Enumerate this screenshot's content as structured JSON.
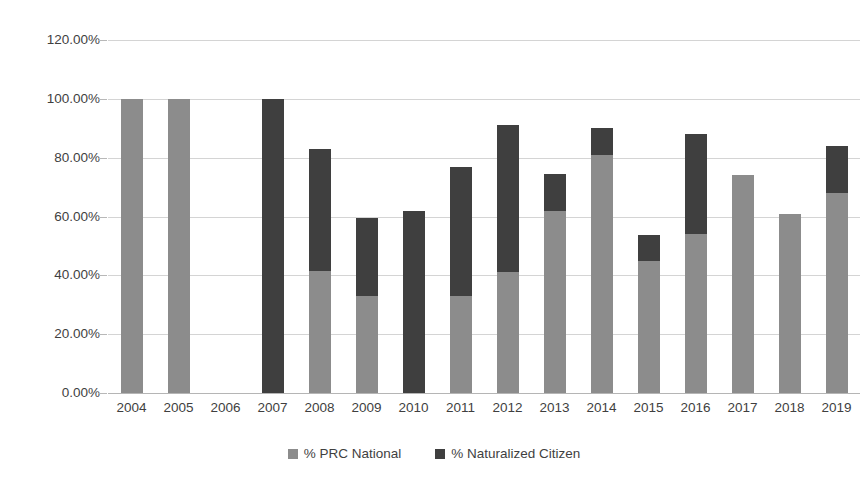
{
  "chart_data": {
    "type": "bar",
    "stacked": true,
    "title": "",
    "subtitle": "",
    "xlabel": "",
    "ylabel": "",
    "categories": [
      "2004",
      "2005",
      "2006",
      "2007",
      "2008",
      "2009",
      "2010",
      "2011",
      "2012",
      "2013",
      "2014",
      "2015",
      "2016",
      "2017",
      "2018",
      "2019"
    ],
    "series": [
      {
        "name": "% PRC National",
        "color": "#8c8c8c",
        "values": [
          100.0,
          100.0,
          0.0,
          0.0,
          41.5,
          33.0,
          0.0,
          33.0,
          41.0,
          62.0,
          81.0,
          45.0,
          54.0,
          74.0,
          60.7,
          68.0
        ]
      },
      {
        "name": "% Naturalized Citizen",
        "color": "#3f3f3f",
        "values": [
          0.0,
          0.0,
          0.0,
          100.0,
          41.5,
          26.5,
          62.0,
          44.0,
          50.0,
          12.5,
          9.0,
          8.7,
          34.0,
          0.0,
          0.0,
          16.0
        ]
      }
    ],
    "totals": [
      100.0,
      100.0,
      0.0,
      100.0,
      83.0,
      59.5,
      62.0,
      77.0,
      91.0,
      74.5,
      90.0,
      53.7,
      88.0,
      74.0,
      60.7,
      84.0
    ],
    "ylim": [
      0,
      120
    ],
    "ytick_values": [
      0,
      20,
      40,
      60,
      80,
      100,
      120
    ],
    "ytick_labels": [
      "0.00%",
      "20.00%",
      "40.00%",
      "60.00%",
      "80.00%",
      "100.00%",
      "120.00%"
    ],
    "grid": true,
    "legend_position": "bottom",
    "legend": [
      {
        "label": "% PRC National",
        "color": "#8c8c8c"
      },
      {
        "label": "% Naturalized Citizen",
        "color": "#3f3f3f"
      }
    ]
  }
}
